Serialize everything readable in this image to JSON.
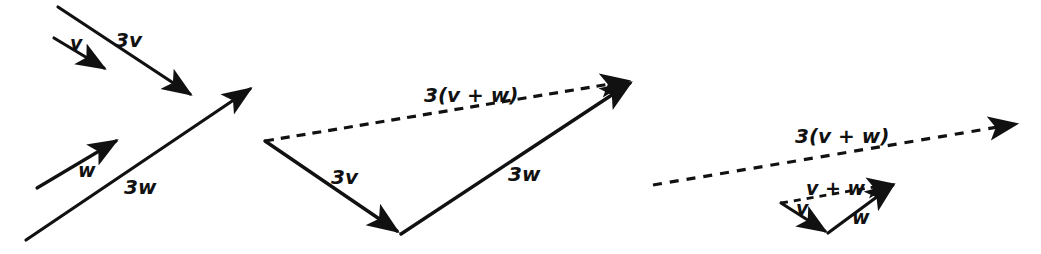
{
  "figure": {
    "background_color": "#ffffff",
    "stroke_color": "#111111",
    "width": 1041,
    "height": 254
  },
  "panels": [
    {
      "id": "left",
      "name": "separate-scaled-vectors",
      "description": "Vector v and its triple 3v above; vector w and its triple 3w below",
      "arrows": [
        {
          "name": "arrow-v",
          "label": "v",
          "style": "solid",
          "x1": 54,
          "y1": 38,
          "x2": 107,
          "y2": 70,
          "label_x": 70,
          "label_y": 50
        },
        {
          "name": "arrow-3v",
          "label": "3v",
          "style": "solid",
          "x1": 58,
          "y1": 7,
          "x2": 194,
          "y2": 97,
          "label_x": 115,
          "label_y": 47
        },
        {
          "name": "arrow-w",
          "label": "w",
          "style": "solid",
          "x1": 37,
          "y1": 188,
          "x2": 119,
          "y2": 139,
          "label_x": 78,
          "label_y": 177
        },
        {
          "name": "arrow-3w",
          "label": "3w",
          "style": "solid",
          "x1": 26,
          "y1": 240,
          "x2": 254,
          "y2": 86,
          "label_x": 124,
          "label_y": 194
        }
      ]
    },
    {
      "id": "middle",
      "name": "scaled-triangle",
      "description": "Triangle formed by 3v then 3w with dashed resultant 3(v + w)",
      "arrows": [
        {
          "name": "arrow-3v-triangle",
          "label": "3v",
          "style": "solid",
          "x1": 265,
          "y1": 141,
          "x2": 401,
          "y2": 234,
          "label_x": 331,
          "label_y": 184
        },
        {
          "name": "arrow-3w-triangle",
          "label": "3w",
          "style": "solid",
          "x1": 401,
          "y1": 234,
          "x2": 634,
          "y2": 80,
          "label_x": 508,
          "label_y": 181
        },
        {
          "name": "arrow-3vplusw-resultant",
          "label": "3(v + w)",
          "style": "dashed",
          "x1": 265,
          "y1": 141,
          "x2": 634,
          "y2": 80,
          "label_x": 424,
          "label_y": 102
        }
      ]
    },
    {
      "id": "right",
      "name": "unscaled-triangle-with-tripled-resultant",
      "description": "Small triangle v then w with dashed resultant v + w, plus the long dashed 3(v + w)",
      "arrows": [
        {
          "name": "arrow-3vplusw-long",
          "label": "3(v + w)",
          "style": "dashed",
          "x1": 653,
          "y1": 185,
          "x2": 1022,
          "y2": 123,
          "label_x": 795,
          "label_y": 143
        },
        {
          "name": "arrow-v-small",
          "label": "v",
          "style": "solid",
          "x1": 781,
          "y1": 203,
          "x2": 828,
          "y2": 233,
          "label_x": 796,
          "label_y": 215
        },
        {
          "name": "arrow-w-small",
          "label": "w",
          "style": "solid",
          "x1": 828,
          "y1": 233,
          "x2": 897,
          "y2": 182,
          "label_x": 852,
          "label_y": 224
        },
        {
          "name": "arrow-vplusw-resultant",
          "label": "v + w",
          "style": "dashed",
          "x1": 781,
          "y1": 203,
          "x2": 897,
          "y2": 182,
          "label_x": 806,
          "label_y": 195
        }
      ]
    }
  ],
  "labels": {
    "v": "v",
    "w": "w",
    "three_v": "3v",
    "three_w": "3w",
    "v_plus_w": "v + w",
    "three_v_plus_w": "3(v + w)"
  }
}
